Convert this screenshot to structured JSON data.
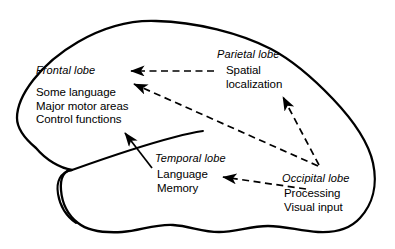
{
  "diagram": {
    "stroke_color": "#000000",
    "background_color": "#ffffff",
    "text_color": "#000000",
    "outline_width_px": 2.2,
    "arrow_width_px": 1.6
  },
  "lobes": [
    {
      "id": "frontal",
      "name": "Frontal lobe",
      "functions": [
        "Some language",
        "Major motor areas",
        "Control functions"
      ]
    },
    {
      "id": "parietal",
      "name": "Parietal lobe",
      "functions": [
        "Spatial",
        "localization"
      ]
    },
    {
      "id": "temporal",
      "name": "Temporal lobe",
      "functions": [
        "Language",
        "Memory"
      ]
    },
    {
      "id": "occipital",
      "name": "Occipital lobe",
      "functions": [
        "Processing",
        "Visual input"
      ]
    }
  ],
  "arrows": [
    {
      "id": "parietal-to-frontal",
      "style": "dashed",
      "from": "Parietal lobe",
      "to": "Frontal lobe",
      "x1": 214,
      "y1": 71,
      "x2": 128,
      "y2": 71
    },
    {
      "id": "occipital-to-frontal",
      "style": "dashed",
      "from": "Occipital lobe",
      "to": "Frontal lobe",
      "x1": 318,
      "y1": 166,
      "x2": 131,
      "y2": 83
    },
    {
      "id": "occipital-to-parietal",
      "style": "dashed",
      "from": "Occipital lobe",
      "to": "Parietal lobe",
      "x1": 319,
      "y1": 165,
      "x2": 282,
      "y2": 95
    },
    {
      "id": "occipital-to-temporal",
      "style": "dashed",
      "from": "Occipital lobe",
      "to": "Temporal lobe",
      "x1": 306,
      "y1": 189,
      "x2": 220,
      "y2": 177
    },
    {
      "id": "temporal-to-frontal",
      "style": "solid",
      "from": "Temporal lobe",
      "to": "Frontal lobe",
      "x1": 152,
      "y1": 168,
      "x2": 123,
      "y2": 130
    }
  ]
}
